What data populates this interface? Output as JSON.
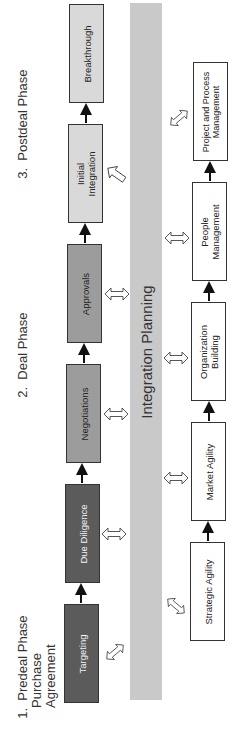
{
  "phases": [
    {
      "number": "1.",
      "lines": [
        "Predeal Phase",
        "Purchase",
        "Agreement"
      ]
    },
    {
      "number": "2.",
      "lines": [
        "Deal Phase"
      ]
    },
    {
      "number": "3.",
      "lines": [
        "Postdeal Phase"
      ]
    }
  ],
  "top_flow": [
    {
      "label": "Targeting",
      "shade": "dark"
    },
    {
      "label": "Due Diligence",
      "shade": "dark"
    },
    {
      "label": "Negotiations",
      "shade": "mid"
    },
    {
      "label": "Approvals",
      "shade": "mid"
    },
    {
      "label": "Initial\nIntegration",
      "shade": "light"
    },
    {
      "label": "Breakthrough",
      "shade": "light"
    }
  ],
  "center_band": {
    "label": "Integration Planning"
  },
  "bottom_flow": [
    {
      "label": "Strategic Agility"
    },
    {
      "label": "Market Agility"
    },
    {
      "label": "Organization\nBuilding"
    },
    {
      "label": "People\nManagement"
    },
    {
      "label": "Project and Process\nManagement"
    }
  ],
  "colors": {
    "dark_box": "#5b5b5b",
    "mid_box": "#9c9c9c",
    "light_box": "#d9d9d9",
    "band": "#c9c9c9",
    "border": "#333333"
  }
}
